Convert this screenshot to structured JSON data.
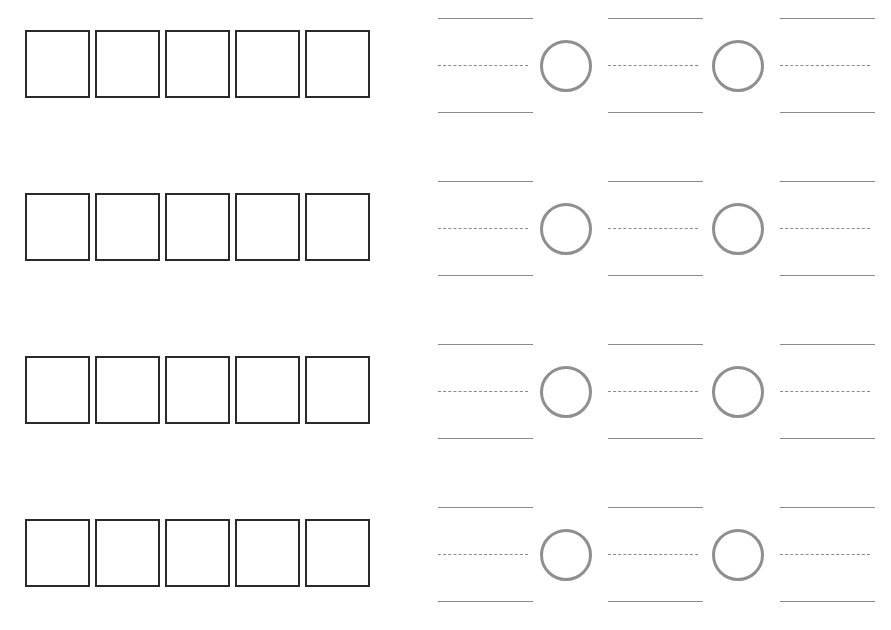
{
  "worksheet": {
    "rows": [
      {
        "boxes": 5,
        "fractions": 3,
        "comparison_circles": 2
      },
      {
        "boxes": 5,
        "fractions": 3,
        "comparison_circles": 2
      },
      {
        "boxes": 5,
        "fractions": 3,
        "comparison_circles": 2
      },
      {
        "boxes": 5,
        "fractions": 3,
        "comparison_circles": 2
      }
    ],
    "colors": {
      "box_border": "#2a2a2a",
      "line": "#8a8a8a",
      "circle": "#8f8f8f"
    }
  }
}
